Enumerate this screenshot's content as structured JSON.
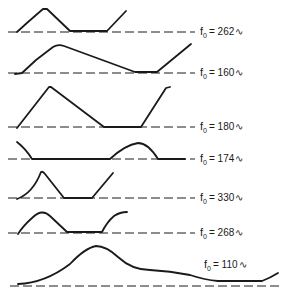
{
  "figure": {
    "type": "waveform-diagram",
    "stroke_color": "#1a1a1a",
    "background": "#ffffff",
    "rows": [
      {
        "label_symbol": "f",
        "label_subscript": "0",
        "label_value": "= 262",
        "label_unit": "∿",
        "baseline_y": 32,
        "label_x": 200,
        "label_y": 26,
        "dash_x": [
          8,
          195
        ],
        "path": "M17,32 L28,22 L43,9 L47,9 L70,31 L107,31 L126,11"
      },
      {
        "label_symbol": "f",
        "label_subscript": "0",
        "label_value": "= 160",
        "label_unit": "∿",
        "baseline_y": 73,
        "label_x": 200,
        "label_y": 67,
        "dash_x": [
          8,
          195
        ],
        "path": "M15,74 L22,73 L36,60 L53,47 Q58,44 64,46 L135,72 L157,72 L191,44"
      },
      {
        "label_symbol": "f",
        "label_subscript": "0",
        "label_value": "= 180",
        "label_unit": "∿",
        "baseline_y": 127,
        "label_x": 200,
        "label_y": 121,
        "dash_x": [
          8,
          195
        ],
        "path": "M17,128 L49,87 L51,87 L104,127 L141,127 L166,88 L170,87"
      },
      {
        "label_symbol": "f",
        "label_subscript": "0",
        "label_value": "= 174",
        "label_unit": "∿",
        "baseline_y": 159,
        "label_x": 200,
        "label_y": 153,
        "dash_x": [
          8,
          195
        ],
        "path": "M17,142 Q26,149 32,159 L110,159 Q125,145 138,143 Q148,143 158,159 L185,159"
      },
      {
        "label_symbol": "f",
        "label_subscript": "0",
        "label_value": "= 330",
        "label_unit": "∿",
        "baseline_y": 198,
        "label_x": 200,
        "label_y": 192,
        "dash_x": [
          8,
          195
        ],
        "path": "M17,199 Q33,193 41,172 Q43,171 45,174 L64,198 L92,198 L113,173"
      },
      {
        "label_symbol": "f",
        "label_subscript": "0",
        "label_value": "= 268",
        "label_unit": "∿",
        "baseline_y": 233,
        "label_x": 200,
        "label_y": 227,
        "dash_x": [
          8,
          195
        ],
        "path": "M18,234 Q23,226 32,218 Q42,208 50,216 L67,232 L102,232 Q107,222 114,216 Q120,212 127,212"
      },
      {
        "label_symbol": "f",
        "label_subscript": "0",
        "label_value": "= 110",
        "label_unit": "∿",
        "baseline_y": 286,
        "label_x": 204,
        "label_y": 259,
        "dash_x": [
          10,
          283
        ],
        "path": "M18,284 Q45,283 70,264 Q85,248 96,246 Q106,246 118,257 Q132,270 150,270 Q170,271 190,275 Q205,280 218,281 L262,281 Q270,278 278,273"
      }
    ]
  }
}
